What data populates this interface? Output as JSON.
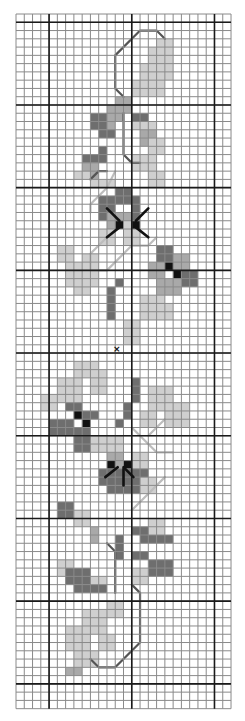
{
  "chart": {
    "title": "Cross-stitch floral vine border pattern",
    "origin": {
      "x": 16,
      "y": 14
    },
    "cell": 8.27,
    "cols": 26,
    "rows": 84,
    "major_every": 10,
    "major_col_offset": 4,
    "major_row_offset": 1,
    "colors": {
      "background": "#ffffff",
      "minor_line": "#8a8a8a",
      "major_line": "#1a1a1a",
      "light": "#cfcfcf",
      "mid": "#a9a9a9",
      "dark": "#6e6e6e",
      "black": "#111111",
      "backstitch": "#555555",
      "backstitch_light": "#bdbdbd"
    },
    "center_mark": {
      "symbol": "×",
      "col": 12.2,
      "row": 40.6
    },
    "cells": [
      {
        "c": 16,
        "r": 4,
        "w": 3,
        "h": 2,
        "t": "light"
      },
      {
        "c": 15,
        "r": 6,
        "w": 4,
        "h": 2,
        "t": "light"
      },
      {
        "c": 17,
        "r": 3,
        "w": 2,
        "h": 2,
        "t": "light"
      },
      {
        "c": 14,
        "r": 8,
        "w": 4,
        "h": 2,
        "t": "light"
      },
      {
        "c": 12,
        "r": 10,
        "w": 2,
        "h": 2,
        "t": "mid"
      },
      {
        "c": 11,
        "r": 11,
        "w": 2,
        "h": 2,
        "t": "mid"
      },
      {
        "c": 9,
        "r": 12,
        "w": 2,
        "h": 2,
        "t": "dark"
      },
      {
        "c": 11,
        "r": 12,
        "w": 1,
        "h": 3,
        "t": "mid"
      },
      {
        "c": 10,
        "r": 14,
        "w": 2,
        "h": 1,
        "t": "dark"
      },
      {
        "c": 14,
        "r": 12,
        "w": 2,
        "h": 1,
        "t": "dark"
      },
      {
        "c": 14,
        "r": 13,
        "w": 3,
        "h": 1,
        "t": "light"
      },
      {
        "c": 15,
        "r": 14,
        "w": 2,
        "h": 2,
        "t": "mid"
      },
      {
        "c": 16,
        "r": 15,
        "w": 2,
        "h": 2,
        "t": "light"
      },
      {
        "c": 8,
        "r": 17,
        "w": 3,
        "h": 1,
        "t": "dark"
      },
      {
        "c": 8,
        "r": 18,
        "w": 2,
        "h": 2,
        "t": "mid"
      },
      {
        "c": 7,
        "r": 19,
        "w": 2,
        "h": 1,
        "t": "light"
      },
      {
        "c": 9,
        "r": 20,
        "w": 3,
        "h": 1,
        "t": "light"
      },
      {
        "c": 10,
        "r": 16,
        "w": 1,
        "h": 2,
        "t": "dark"
      },
      {
        "c": 14,
        "r": 17,
        "w": 3,
        "h": 2,
        "t": "light"
      },
      {
        "c": 16,
        "r": 19,
        "w": 2,
        "h": 2,
        "t": "light"
      },
      {
        "c": 10,
        "r": 22,
        "w": 2,
        "h": 3,
        "t": "dark"
      },
      {
        "c": 12,
        "r": 21,
        "w": 2,
        "h": 2,
        "t": "dark"
      },
      {
        "c": 14,
        "r": 22,
        "w": 1,
        "h": 3,
        "t": "dark"
      },
      {
        "c": 11,
        "r": 24,
        "w": 3,
        "h": 2,
        "t": "mid"
      },
      {
        "c": 10,
        "r": 26,
        "w": 2,
        "h": 2,
        "t": "light"
      },
      {
        "c": 13,
        "r": 26,
        "w": 2,
        "h": 2,
        "t": "light"
      },
      {
        "c": 12,
        "r": 25,
        "w": 1,
        "h": 1,
        "t": "black"
      },
      {
        "c": 13,
        "r": 25,
        "w": 1,
        "h": 1,
        "t": "light"
      },
      {
        "c": 14,
        "r": 25,
        "w": 1,
        "h": 1,
        "t": "black"
      },
      {
        "c": 5,
        "r": 28,
        "w": 2,
        "h": 2,
        "t": "light"
      },
      {
        "c": 6,
        "r": 30,
        "w": 4,
        "h": 3,
        "t": "light"
      },
      {
        "c": 8,
        "r": 29,
        "w": 2,
        "h": 2,
        "t": "light"
      },
      {
        "c": 7,
        "r": 33,
        "w": 2,
        "h": 1,
        "t": "light"
      },
      {
        "c": 17,
        "r": 28,
        "w": 2,
        "h": 2,
        "t": "dark"
      },
      {
        "c": 19,
        "r": 29,
        "w": 2,
        "h": 2,
        "t": "mid"
      },
      {
        "c": 16,
        "r": 30,
        "w": 2,
        "h": 2,
        "t": "mid"
      },
      {
        "c": 18,
        "r": 30,
        "w": 1,
        "h": 1,
        "t": "black"
      },
      {
        "c": 19,
        "r": 31,
        "w": 1,
        "h": 1,
        "t": "black"
      },
      {
        "c": 20,
        "r": 31,
        "w": 2,
        "h": 2,
        "t": "dark"
      },
      {
        "c": 17,
        "r": 32,
        "w": 3,
        "h": 2,
        "t": "mid"
      },
      {
        "c": 12,
        "r": 32,
        "w": 1,
        "h": 1,
        "t": "dark"
      },
      {
        "c": 11,
        "r": 33,
        "w": 1,
        "h": 4,
        "t": "dark"
      },
      {
        "c": 15,
        "r": 34,
        "w": 3,
        "h": 3,
        "t": "light"
      },
      {
        "c": 13,
        "r": 37,
        "w": 2,
        "h": 3,
        "t": "light"
      },
      {
        "c": 16,
        "r": 35,
        "w": 3,
        "h": 2,
        "t": "light"
      },
      {
        "c": 14,
        "r": 44,
        "w": 1,
        "h": 3,
        "t": "dark"
      },
      {
        "c": 13,
        "r": 47,
        "w": 1,
        "h": 2,
        "t": "dark"
      },
      {
        "c": 12,
        "r": 49,
        "w": 1,
        "h": 1,
        "t": "dark"
      },
      {
        "c": 5,
        "r": 44,
        "w": 3,
        "h": 3,
        "t": "light"
      },
      {
        "c": 7,
        "r": 42,
        "w": 3,
        "h": 2,
        "t": "light"
      },
      {
        "c": 9,
        "r": 43,
        "w": 2,
        "h": 3,
        "t": "light"
      },
      {
        "c": 3,
        "r": 46,
        "w": 2,
        "h": 2,
        "t": "light"
      },
      {
        "c": 6,
        "r": 47,
        "w": 2,
        "h": 1,
        "t": "dark"
      },
      {
        "c": 7,
        "r": 48,
        "w": 1,
        "h": 1,
        "t": "black"
      },
      {
        "c": 8,
        "r": 48,
        "w": 2,
        "h": 1,
        "t": "dark"
      },
      {
        "c": 4,
        "r": 49,
        "w": 3,
        "h": 2,
        "t": "dark"
      },
      {
        "c": 8,
        "r": 49,
        "w": 1,
        "h": 1,
        "t": "black"
      },
      {
        "c": 7,
        "r": 50,
        "w": 2,
        "h": 3,
        "t": "dark"
      },
      {
        "c": 16,
        "r": 45,
        "w": 3,
        "h": 3,
        "t": "light"
      },
      {
        "c": 18,
        "r": 47,
        "w": 3,
        "h": 3,
        "t": "light"
      },
      {
        "c": 15,
        "r": 48,
        "w": 2,
        "h": 2,
        "t": "light"
      },
      {
        "c": 9,
        "r": 51,
        "w": 4,
        "h": 2,
        "t": "light"
      },
      {
        "c": 11,
        "r": 53,
        "w": 2,
        "h": 2,
        "t": "mid"
      },
      {
        "c": 11,
        "r": 54,
        "w": 1,
        "h": 1,
        "t": "black"
      },
      {
        "c": 13,
        "r": 54,
        "w": 1,
        "h": 1,
        "t": "black"
      },
      {
        "c": 14,
        "r": 53,
        "w": 2,
        "h": 2,
        "t": "light"
      },
      {
        "c": 10,
        "r": 55,
        "w": 6,
        "h": 2,
        "t": "dark"
      },
      {
        "c": 11,
        "r": 57,
        "w": 4,
        "h": 1,
        "t": "dark"
      },
      {
        "c": 15,
        "r": 56,
        "w": 2,
        "h": 2,
        "t": "light"
      },
      {
        "c": 5,
        "r": 59,
        "w": 2,
        "h": 2,
        "t": "dark"
      },
      {
        "c": 7,
        "r": 60,
        "w": 2,
        "h": 2,
        "t": "light"
      },
      {
        "c": 9,
        "r": 62,
        "w": 1,
        "h": 2,
        "t": "mid"
      },
      {
        "c": 14,
        "r": 62,
        "w": 3,
        "h": 1,
        "t": "dark"
      },
      {
        "c": 16,
        "r": 61,
        "w": 2,
        "h": 2,
        "t": "light"
      },
      {
        "c": 12,
        "r": 63,
        "w": 1,
        "h": 1,
        "t": "dark"
      },
      {
        "c": 12,
        "r": 64,
        "w": 1,
        "h": 2,
        "t": "dark"
      },
      {
        "c": 15,
        "r": 63,
        "w": 4,
        "h": 1,
        "t": "dark"
      },
      {
        "c": 14,
        "r": 65,
        "w": 2,
        "h": 1,
        "t": "dark"
      },
      {
        "c": 16,
        "r": 66,
        "w": 3,
        "h": 2,
        "t": "dark"
      },
      {
        "c": 14,
        "r": 67,
        "w": 2,
        "h": 2,
        "t": "light"
      },
      {
        "c": 5,
        "r": 66,
        "w": 2,
        "h": 2,
        "t": "light"
      },
      {
        "c": 6,
        "r": 67,
        "w": 3,
        "h": 2,
        "t": "dark"
      },
      {
        "c": 7,
        "r": 69,
        "w": 4,
        "h": 1,
        "t": "dark"
      },
      {
        "c": 9,
        "r": 68,
        "w": 2,
        "h": 1,
        "t": "light"
      },
      {
        "c": 11,
        "r": 71,
        "w": 2,
        "h": 2,
        "t": "light"
      },
      {
        "c": 8,
        "r": 72,
        "w": 3,
        "h": 3,
        "t": "light"
      },
      {
        "c": 6,
        "r": 74,
        "w": 3,
        "h": 3,
        "t": "light"
      },
      {
        "c": 10,
        "r": 75,
        "w": 2,
        "h": 2,
        "t": "light"
      },
      {
        "c": 7,
        "r": 77,
        "w": 3,
        "h": 2,
        "t": "light"
      },
      {
        "c": 6,
        "r": 79,
        "w": 2,
        "h": 1,
        "t": "mid"
      }
    ],
    "backstitch": [
      {
        "tone": "backstitch",
        "pts": [
          [
            13,
            10
          ],
          [
            12,
            9
          ],
          [
            12,
            5
          ],
          [
            15,
            2
          ],
          [
            17,
            2
          ],
          [
            18,
            3
          ]
        ]
      },
      {
        "tone": "backstitch",
        "pts": [
          [
            13,
            12
          ],
          [
            13,
            17
          ],
          [
            14,
            18
          ],
          [
            15,
            18
          ]
        ]
      },
      {
        "tone": "backstitch",
        "pts": [
          [
            9,
            20
          ],
          [
            10,
            19
          ],
          [
            11,
            19
          ]
        ]
      },
      {
        "tone": "backstitch_light",
        "pts": [
          [
            12,
            19
          ],
          [
            11,
            21
          ],
          [
            9,
            23
          ],
          [
            9,
            24
          ]
        ]
      },
      {
        "tone": "backstitch_light",
        "pts": [
          [
            11,
            27
          ],
          [
            9,
            29
          ],
          [
            9,
            31
          ],
          [
            11,
            31
          ],
          [
            13,
            29
          ]
        ]
      },
      {
        "tone": "backstitch_light",
        "pts": [
          [
            13,
            29
          ],
          [
            14,
            28
          ],
          [
            16,
            28
          ],
          [
            17,
            27
          ]
        ]
      },
      {
        "tone": "backstitch_light",
        "pts": [
          [
            16,
            51
          ],
          [
            17,
            50
          ],
          [
            18,
            49
          ]
        ]
      },
      {
        "tone": "backstitch_light",
        "pts": [
          [
            14,
            50
          ],
          [
            17,
            53
          ],
          [
            19,
            53
          ]
        ]
      },
      {
        "tone": "backstitch_light",
        "pts": [
          [
            18,
            56
          ],
          [
            16,
            58
          ],
          [
            14,
            60
          ]
        ]
      },
      {
        "tone": "backstitch",
        "pts": [
          [
            11,
            64
          ],
          [
            12,
            65
          ],
          [
            12,
            70
          ]
        ]
      },
      {
        "tone": "backstitch",
        "pts": [
          [
            14,
            69
          ],
          [
            15,
            70
          ],
          [
            15,
            76
          ],
          [
            12,
            79
          ],
          [
            10,
            79
          ],
          [
            9,
            78
          ]
        ]
      }
    ],
    "center_lines": [
      {
        "tone": "black",
        "pts": [
          [
            11,
            23.5
          ],
          [
            12.5,
            25
          ]
        ]
      },
      {
        "tone": "black",
        "pts": [
          [
            16,
            23.5
          ],
          [
            14.5,
            25
          ]
        ]
      },
      {
        "tone": "black",
        "pts": [
          [
            11,
            27
          ],
          [
            12.5,
            25.8
          ]
        ]
      },
      {
        "tone": "black",
        "pts": [
          [
            16,
            27
          ],
          [
            14.5,
            25.8
          ]
        ]
      },
      {
        "tone": "black",
        "pts": [
          [
            10.8,
            56
          ],
          [
            12.3,
            54.8
          ]
        ]
      },
      {
        "tone": "black",
        "pts": [
          [
            14.2,
            56
          ],
          [
            13,
            54.8
          ]
        ]
      },
      {
        "tone": "black",
        "pts": [
          [
            13,
            55
          ],
          [
            13,
            57
          ]
        ]
      }
    ]
  }
}
